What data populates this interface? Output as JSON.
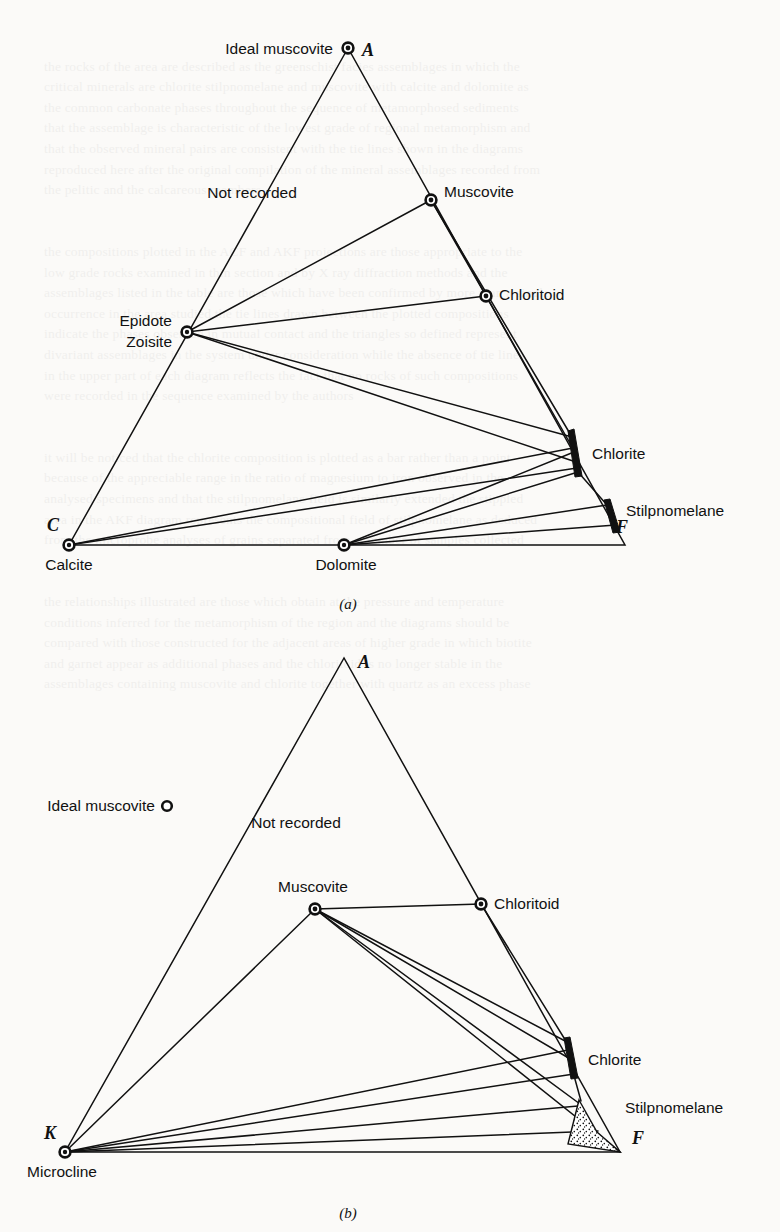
{
  "figure": {
    "panels": [
      {
        "id": "a",
        "caption": "(a)",
        "type": "ACF",
        "apex_labels": {
          "top": "A",
          "left": "C",
          "right": "F"
        },
        "vertices": {
          "A": {
            "x": 348,
            "y": 48
          },
          "C": {
            "x": 69,
            "y": 545
          },
          "F": {
            "x": 625,
            "y": 545
          }
        },
        "field_note": "Not recorded",
        "points": [
          {
            "name": "Ideal muscovite",
            "label": "Ideal muscovite",
            "x": 348,
            "y": 48,
            "marker": "circle",
            "label_anchor": "end",
            "label_dx": -14,
            "label_dy": 5
          },
          {
            "name": "Muscovite",
            "label": "Muscovite",
            "x": 431,
            "y": 200,
            "marker": "circle",
            "label_anchor": "start",
            "label_dx": 13,
            "label_dy": -3
          },
          {
            "name": "Chloritoid",
            "label": "Chloritoid",
            "x": 486,
            "y": 296,
            "marker": "circle",
            "label_anchor": "start",
            "label_dx": 13,
            "label_dy": 1
          },
          {
            "name": "Epidote Zoisite",
            "label": "Epidote",
            "label2": "Zoisite",
            "x": 187,
            "y": 332,
            "marker": "circle",
            "label_anchor": "end",
            "label_dx": -15,
            "label_dy": -6
          },
          {
            "name": "Chlorite",
            "label": "Chlorite",
            "x": 574,
            "y": 455,
            "marker": "bar",
            "label_anchor": "start",
            "label_dx": 18,
            "label_dy": 5
          },
          {
            "name": "Stilpnomelane",
            "label": "Stilpnomelane",
            "x": 614,
            "y": 521,
            "marker": "bar-small",
            "label_anchor": "start",
            "label_dx": 16,
            "label_dy": -4
          },
          {
            "name": "Calcite",
            "label": "Calcite",
            "x": 69,
            "y": 545,
            "marker": "circle",
            "label_anchor": "middle",
            "label_dx": 5,
            "label_dy": 24
          },
          {
            "name": "Dolomite",
            "label": "Dolomite",
            "x": 344,
            "y": 545,
            "marker": "circle",
            "label_anchor": "middle",
            "label_dx": 2,
            "label_dy": 24
          }
        ],
        "tie_lines": [
          {
            "from": "Epidote Zoisite",
            "to": "Muscovite"
          },
          {
            "from": "Epidote Zoisite",
            "to": "Chloritoid"
          },
          {
            "from": "Muscovite",
            "to": "Chloritoid"
          },
          {
            "from": "Muscovite",
            "to": "Chlorite"
          },
          {
            "from": "Chloritoid",
            "to": "Chlorite"
          },
          {
            "from": "Epidote Zoisite",
            "to": "Chlorite"
          },
          {
            "from": "Epidote Zoisite",
            "to": "Chlorite-lower"
          },
          {
            "from": "Calcite",
            "to": "Chlorite"
          },
          {
            "from": "Calcite",
            "to": "Chlorite-lower"
          },
          {
            "from": "Dolomite",
            "to": "Chlorite"
          },
          {
            "from": "Dolomite",
            "to": "Chlorite-lower"
          },
          {
            "from": "Dolomite",
            "to": "Stilpnomelane"
          },
          {
            "from": "Dolomite",
            "to": "Stilpnomelane-lower"
          },
          {
            "from": "Dolomite",
            "to": "F"
          },
          {
            "from": "Chlorite",
            "to": "Stilpnomelane"
          }
        ]
      },
      {
        "id": "b",
        "caption": "(b)",
        "type": "AKF",
        "apex_labels": {
          "top": "A",
          "left": "K",
          "right": "F"
        },
        "vertices": {
          "A": {
            "x": 344,
            "y": 658
          },
          "K": {
            "x": 65,
            "y": 1152
          },
          "F": {
            "x": 620,
            "y": 1152
          }
        },
        "field_note": "Not recorded",
        "points": [
          {
            "name": "Ideal muscovite",
            "label": "Ideal muscovite",
            "x": 167,
            "y": 806,
            "marker": "circle-small",
            "label_anchor": "end",
            "label_dx": -12,
            "label_dy": 4
          },
          {
            "name": "Muscovite",
            "label": "Muscovite",
            "x": 315,
            "y": 909,
            "marker": "circle",
            "label_anchor": "middle",
            "label_dx": 8,
            "label_dy": -16
          },
          {
            "name": "Chloritoid",
            "label": "Chloritoid",
            "x": 481,
            "y": 904,
            "marker": "circle",
            "label_anchor": "start",
            "label_dx": 13,
            "label_dy": 4
          },
          {
            "name": "Chlorite",
            "label": "Chlorite",
            "x": 570,
            "y": 1059,
            "marker": "bar",
            "label_anchor": "start",
            "label_dx": 16,
            "label_dy": 4
          },
          {
            "name": "Stilpnomelane",
            "label": "Stilpnomelane",
            "x": 590,
            "y": 1115,
            "marker": "stipple",
            "label_anchor": "start",
            "label_dx": 42,
            "label_dy": -6
          },
          {
            "name": "Microcline",
            "label": "Microcline",
            "x": 65,
            "y": 1152,
            "marker": "circle",
            "label_anchor": "middle",
            "label_dx": 2,
            "label_dy": 24
          }
        ],
        "tie_lines": [
          {
            "from": "Muscovite",
            "to": "Chloritoid"
          },
          {
            "from": "Muscovite",
            "to": "Chlorite"
          },
          {
            "from": "Muscovite",
            "to": "Chlorite-lower"
          },
          {
            "from": "Muscovite",
            "to": "Stilpnomelane"
          },
          {
            "from": "Muscovite",
            "to": "F"
          },
          {
            "from": "Chloritoid",
            "to": "Chlorite"
          },
          {
            "from": "Microcline",
            "to": "Muscovite"
          },
          {
            "from": "Microcline",
            "to": "Chlorite"
          },
          {
            "from": "Microcline",
            "to": "Chlorite-lower"
          },
          {
            "from": "Microcline",
            "to": "Stilpnomelane"
          },
          {
            "from": "Microcline",
            "to": "Stilpnomelane-lower"
          },
          {
            "from": "Microcline",
            "to": "F"
          }
        ]
      }
    ]
  },
  "panel_a": {
    "caption": "(a)",
    "apex_A": "A",
    "apex_C": "C",
    "apex_F": "F",
    "not_recorded": "Not recorded",
    "ideal_muscovite": "Ideal muscovite",
    "muscovite": "Muscovite",
    "chloritoid": "Chloritoid",
    "epidote": "Epidote",
    "zoisite": "Zoisite",
    "chlorite": "Chlorite",
    "stilpnomelane": "Stilpnomelane",
    "calcite": "Calcite",
    "dolomite": "Dolomite"
  },
  "panel_b": {
    "caption": "(b)",
    "apex_A": "A",
    "apex_K": "K",
    "apex_F": "F",
    "not_recorded": "Not recorded",
    "ideal_muscovite": "Ideal muscovite",
    "muscovite": "Muscovite",
    "chloritoid": "Chloritoid",
    "chlorite": "Chlorite",
    "stilpnomelane": "Stilpnomelane",
    "microcline": "Microcline"
  },
  "colors": {
    "ink": "#111111",
    "paper": "#fbfaf8"
  }
}
